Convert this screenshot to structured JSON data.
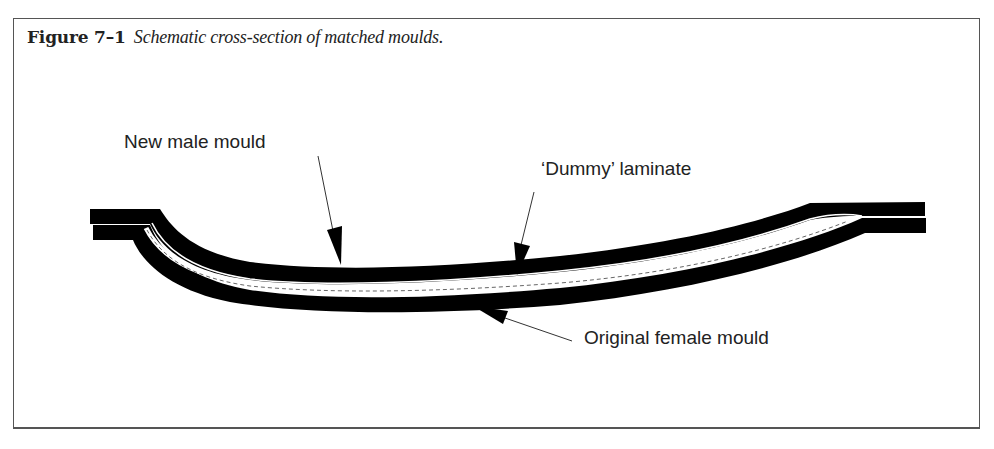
{
  "figure": {
    "number": "Figure 7–1",
    "title": "Schematic cross-section of matched moulds."
  },
  "labels": {
    "male_mould": "New male mould",
    "dummy_laminate": "‘Dummy’ laminate",
    "female_mould": "Original female mould"
  },
  "colors": {
    "ink": "#000000",
    "text": "#222222",
    "frame": "#555555",
    "background": "#ffffff"
  }
}
